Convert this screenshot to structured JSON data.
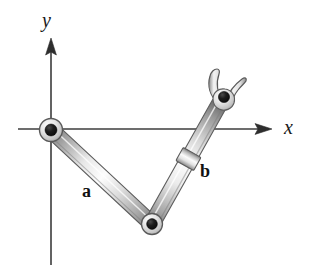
{
  "figure": {
    "background_color": "#ffffff",
    "width": 310,
    "height": 273
  },
  "axes": {
    "x_axis": {
      "label": "x",
      "name": "x-axis",
      "color": "#3a3a3a",
      "start": [
        18,
        129
      ],
      "end": [
        272,
        129
      ],
      "arrow": "right"
    },
    "y_axis": {
      "label": "y",
      "name": "y-axis",
      "color": "#3a3a3a",
      "start": [
        51,
        265
      ],
      "end": [
        51,
        38
      ],
      "arrow": "up"
    },
    "origin": [
      51,
      130
    ]
  },
  "links": [
    {
      "name": "link-a",
      "label": "a",
      "from": [
        51,
        130
      ],
      "to": [
        152,
        224
      ],
      "label_position": [
        88,
        192
      ],
      "fill_light": "#f2f2f2",
      "fill_mid": "#b8b8b8",
      "fill_dark": "#6e6e6e"
    },
    {
      "name": "link-b",
      "label": "b",
      "from": [
        152,
        224
      ],
      "to": [
        221,
        101
      ],
      "label_position": [
        205,
        172
      ],
      "fill_light": "#f2f2f2",
      "fill_mid": "#b8b8b8",
      "fill_dark": "#6e6e6e",
      "collar_position": [
        180,
        160
      ]
    }
  ],
  "joints": [
    {
      "name": "base-pivot",
      "position": [
        51,
        130
      ],
      "outer_radius": 11,
      "inner_radius": 5.5,
      "ring_color": "#dcdcdc",
      "pin_color": "#151515"
    },
    {
      "name": "elbow-pivot",
      "position": [
        152,
        224
      ],
      "outer_radius": 10,
      "inner_radius": 5,
      "ring_color": "#dcdcdc",
      "pin_color": "#151515"
    },
    {
      "name": "gripper-pivot",
      "position": [
        224,
        97
      ],
      "outer_radius": 7,
      "inner_radius": 5,
      "ring_color": "#c9c9c9",
      "pin_color": "#151515"
    }
  ],
  "gripper": {
    "name": "gripper",
    "fingers": 2,
    "finger_left_tip": [
      213,
      70
    ],
    "finger_right_tip": [
      243,
      75
    ],
    "outline_color": "#555555",
    "fill_color": "#f0f0f0"
  },
  "style": {
    "stroke_color": "#4a4a4a",
    "text_color": "#141414"
  }
}
